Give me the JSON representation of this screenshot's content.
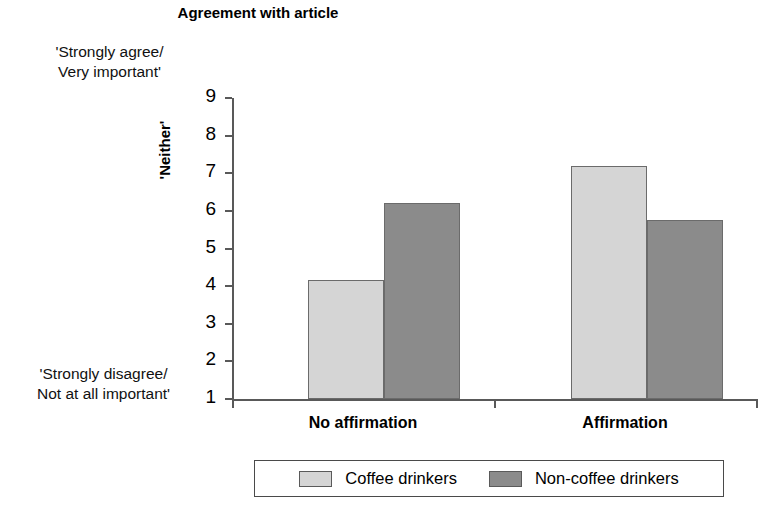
{
  "chart_data": {
    "type": "bar",
    "title": "Agreement with article",
    "xlabel": "",
    "ylabel": "'Neither'",
    "ylim": [
      1,
      9
    ],
    "yticks": [
      1,
      2,
      3,
      4,
      5,
      6,
      7,
      8,
      9
    ],
    "grid": false,
    "legend_position": "bottom",
    "scale_anchor_top": "'Strongly agree/\nVery important'",
    "scale_anchor_bottom": "'Strongly disagree/\nNot at all important'",
    "scale_midpoint_label": "'Neither'",
    "categories": [
      "No affirmation",
      "Affirmation"
    ],
    "series": [
      {
        "name": "Coffee drinkers",
        "color": "#d5d5d5",
        "values": [
          4.15,
          7.2
        ]
      },
      {
        "name": "Non-coffee drinkers",
        "color": "#8b8b8b",
        "values": [
          6.2,
          5.75
        ]
      }
    ]
  },
  "colors": {
    "light_gray": "#d5d5d5",
    "dark_gray": "#8b8b8b",
    "axis": "#595959",
    "text": "#000000",
    "background": "#ffffff"
  },
  "title": "Agreement with article",
  "axis": {
    "y_label": "'Neither'",
    "y_tick_labels": [
      "9",
      "8",
      "7",
      "6",
      "5",
      "4",
      "3",
      "2",
      "1"
    ],
    "anchor_top_line1": "'Strongly agree/",
    "anchor_top_line2": "Very important'",
    "anchor_bottom_line1": "'Strongly disagree/",
    "anchor_bottom_line2": "Not at all important'"
  },
  "category_labels": [
    "No affirmation",
    "Affirmation"
  ],
  "legend": {
    "entries": [
      {
        "label": "Coffee drinkers",
        "swatch": "light"
      },
      {
        "label": "Non-coffee drinkers",
        "swatch": "dark"
      }
    ]
  }
}
